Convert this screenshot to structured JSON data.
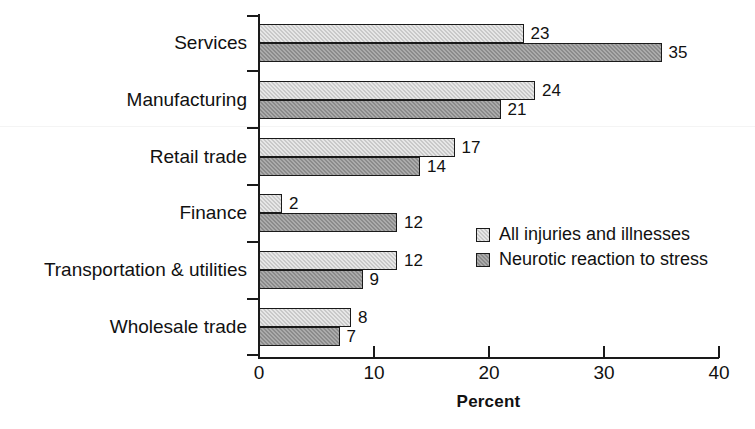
{
  "chart_data": {
    "type": "bar",
    "orientation": "horizontal",
    "title": "",
    "xlabel": "Percent",
    "ylabel": "",
    "xlim": [
      0,
      40
    ],
    "xticks": [
      0,
      10,
      20,
      30,
      40
    ],
    "grid": false,
    "legend_position": "middle-right",
    "categories": [
      "Services",
      "Manufacturing",
      "Retail trade",
      "Finance",
      "Transportation & utilities",
      "Wholesale trade"
    ],
    "series": [
      {
        "name": "All injuries and illnesses",
        "color": "#c9c9c9",
        "values": [
          23,
          24,
          17,
          2,
          12,
          8
        ]
      },
      {
        "name": "Neurotic reaction to stress",
        "color": "#8b8b8b",
        "values": [
          35,
          21,
          14,
          12,
          9,
          7
        ]
      }
    ]
  },
  "axis": {
    "x_title": "Percent",
    "tick_labels": [
      "0",
      "10",
      "20",
      "30",
      "40"
    ]
  },
  "legend": {
    "items": [
      {
        "label": "All injuries and illnesses",
        "swatch": "light"
      },
      {
        "label": "Neurotic reaction to stress",
        "swatch": "dark"
      }
    ]
  },
  "colors": {
    "series_light": "#c9c9c9",
    "series_dark": "#8b8b8b",
    "axis": "#1a1a1a",
    "text": "#111111",
    "background": "#ffffff"
  }
}
